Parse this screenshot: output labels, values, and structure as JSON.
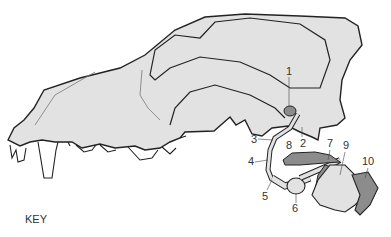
{
  "diagram": {
    "key_label": "KEY",
    "colors": {
      "bone_fill": "#e2e2e2",
      "dark_fill": "#8c8c8c",
      "outline": "#222222",
      "background": "#ffffff"
    },
    "labels": [
      {
        "id": "1",
        "text": "1",
        "x": 286,
        "y": 66
      },
      {
        "id": "2",
        "text": "2",
        "x": 300,
        "y": 141
      },
      {
        "id": "3",
        "text": "3",
        "x": 252,
        "y": 135
      },
      {
        "id": "4",
        "text": "4",
        "x": 249,
        "y": 158
      },
      {
        "id": "5",
        "text": "5",
        "x": 263,
        "y": 192
      },
      {
        "id": "6",
        "text": "6",
        "x": 293,
        "y": 206
      },
      {
        "id": "7",
        "text": "7",
        "x": 327,
        "y": 139
      },
      {
        "id": "8",
        "text": "8",
        "x": 286,
        "y": 142
      },
      {
        "id": "9",
        "text": "9",
        "x": 343,
        "y": 141
      },
      {
        "id": "10",
        "text": "10",
        "x": 363,
        "y": 157
      }
    ]
  }
}
